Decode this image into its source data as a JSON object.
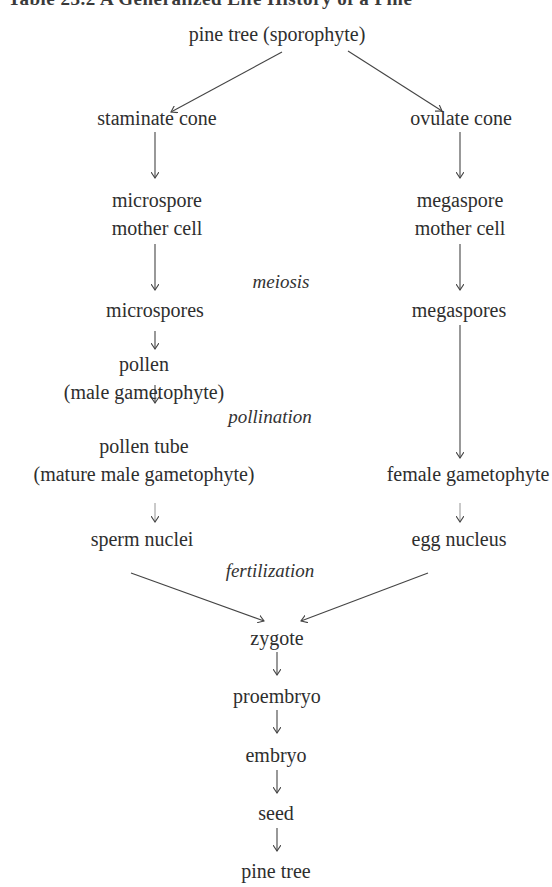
{
  "title": "Table 23.2 A Generalized Life History of a Pine",
  "nodes": {
    "pine_tree_sporophyte": "pine tree (sporophyte)",
    "staminate_cone": "staminate cone",
    "ovulate_cone": "ovulate cone",
    "microspore_mother_cell_1": "microspore",
    "microspore_mother_cell_2": "mother cell",
    "megaspore_mother_cell_1": "megaspore",
    "megaspore_mother_cell_2": "mother cell",
    "microspores": "microspores",
    "megaspores": "megaspores",
    "pollen_1": "pollen",
    "pollen_2": "(male gametophyte)",
    "pollen_tube_1": "pollen tube",
    "pollen_tube_2": "(mature male gametophyte)",
    "female_gametophyte": "female gametophyte",
    "sperm_nuclei": "sperm nuclei",
    "egg_nucleus": "egg nucleus",
    "zygote": "zygote",
    "proembryo": "proembryo",
    "embryo": "embryo",
    "seed": "seed",
    "pine_tree": "pine tree"
  },
  "process_labels": {
    "meiosis": "meiosis",
    "pollination": "pollination",
    "fertilization": "fertilization"
  },
  "edges": [
    [
      "pine tree (sporophyte)",
      "staminate cone"
    ],
    [
      "pine tree (sporophyte)",
      "ovulate cone"
    ],
    [
      "staminate cone",
      "microspore mother cell"
    ],
    [
      "ovulate cone",
      "megaspore mother cell"
    ],
    [
      "microspore mother cell",
      "microspores"
    ],
    [
      "megaspore mother cell",
      "megaspores"
    ],
    [
      "microspores",
      "pollen (male gametophyte)"
    ],
    [
      "pollen (male gametophyte)",
      "pollen tube (mature male gametophyte)"
    ],
    [
      "megaspores",
      "female gametophyte"
    ],
    [
      "pollen tube (mature male gametophyte)",
      "sperm nuclei"
    ],
    [
      "female gametophyte",
      "egg nucleus"
    ],
    [
      "sperm nuclei",
      "zygote"
    ],
    [
      "egg nucleus",
      "zygote"
    ],
    [
      "zygote",
      "proembryo"
    ],
    [
      "proembryo",
      "embryo"
    ],
    [
      "embryo",
      "seed"
    ],
    [
      "seed",
      "pine tree"
    ]
  ],
  "colors": {
    "text": "#2e2e2e",
    "arrow": "#444444",
    "background": "#ffffff"
  }
}
